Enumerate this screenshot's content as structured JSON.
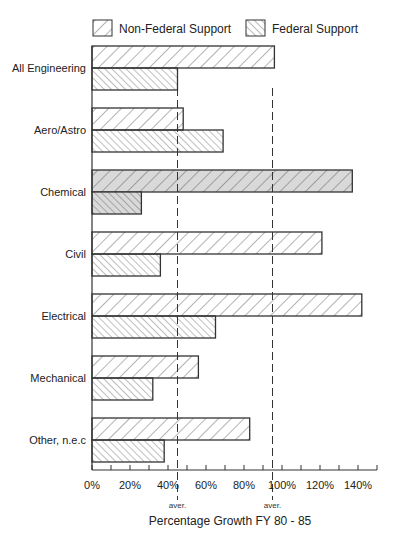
{
  "chart_data": {
    "type": "bar",
    "orientation": "horizontal",
    "title": "",
    "xlabel": "Percentage Growth FY 80 - 85",
    "ylabel": "",
    "xlim": [
      0,
      150
    ],
    "xticks": [
      "0%",
      "20%",
      "40%",
      "60%",
      "80%",
      "100%",
      "120%",
      "140%"
    ],
    "categories": [
      "All Engineering",
      "Aero/Astro",
      "Chemical",
      "Civil",
      "Electrical",
      "Mechanical",
      "Other, n.e.c"
    ],
    "series": [
      {
        "name": "Non-Federal Support",
        "pattern": "back-diagonal-hatch",
        "values": [
          96,
          48,
          137,
          121,
          142,
          56,
          83
        ]
      },
      {
        "name": "Federal Support",
        "pattern": "forward-diagonal-hatch",
        "values": [
          45,
          69,
          26,
          36,
          65,
          32,
          38
        ]
      }
    ],
    "highlighted_category": "Chemical",
    "highlight_color": "#d9d9d9",
    "reference_lines": [
      {
        "value": 45,
        "label": "aver.",
        "series": "Federal Support",
        "style": "dashed"
      },
      {
        "value": 95,
        "label": "aver.",
        "series": "Non-Federal Support",
        "style": "dashed"
      }
    ],
    "legend": {
      "position": "top",
      "entries": [
        "Non-Federal Support",
        "Federal Support"
      ]
    },
    "grid": false
  }
}
